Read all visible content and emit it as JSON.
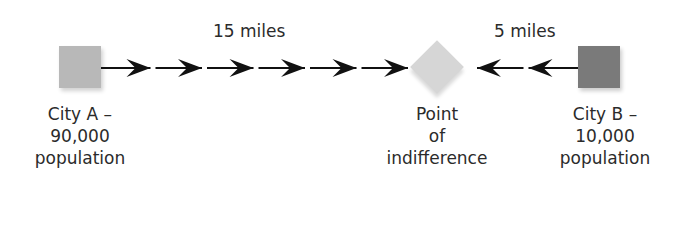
{
  "diagram": {
    "distance_labels": {
      "left": "15 miles",
      "right": "5 miles"
    },
    "nodes": [
      {
        "id": "city-a",
        "shape": "square",
        "color": "#b8b8b8",
        "lines": [
          "City A –",
          "90,000",
          "population"
        ]
      },
      {
        "id": "point-of-indifference",
        "shape": "diamond",
        "color": "#d6d6d6",
        "lines": [
          "Point",
          "of",
          "indifference"
        ]
      },
      {
        "id": "city-b",
        "shape": "square",
        "color": "#7a7a7a",
        "lines": [
          "City B –",
          "10,000",
          "population"
        ]
      }
    ],
    "edges": [
      {
        "from": "city-a",
        "to": "point-of-indifference",
        "arrow_count": 6,
        "direction": "right",
        "distance": "15 miles"
      },
      {
        "from": "city-b",
        "to": "point-of-indifference",
        "arrow_count": 2,
        "direction": "left",
        "distance": "5 miles"
      }
    ],
    "arrow_color": "#111111"
  }
}
